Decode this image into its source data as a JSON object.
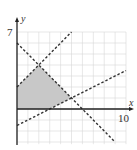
{
  "chart_data": {
    "type": "line",
    "title": "",
    "xlabel": "x",
    "ylabel": "y",
    "xlim": [
      0,
      10
    ],
    "ylim": [
      -3,
      7
    ],
    "grid": true,
    "tick_labels": {
      "x": [
        "10"
      ],
      "y": [
        "7"
      ]
    },
    "series": [
      {
        "name": "y = 6 - x",
        "style": "dashed",
        "points": [
          [
            0,
            6
          ],
          [
            9,
            -3
          ]
        ]
      },
      {
        "name": "y = x + 2",
        "style": "dashed",
        "points": [
          [
            0,
            2
          ],
          [
            5,
            7
          ]
        ]
      },
      {
        "name": "y = 0.5x - 1.5",
        "style": "dashed",
        "points": [
          [
            0,
            -1.5
          ],
          [
            10,
            3.5
          ]
        ]
      }
    ],
    "shaded_region": {
      "fill": "#c8c8c8",
      "vertices": [
        [
          0,
          0
        ],
        [
          3,
          0
        ],
        [
          5,
          1
        ],
        [
          2,
          4
        ],
        [
          0,
          2
        ]
      ]
    }
  },
  "labels": {
    "x_axis": "x",
    "y_axis": "y",
    "x_max": "10",
    "y_max": "7"
  }
}
